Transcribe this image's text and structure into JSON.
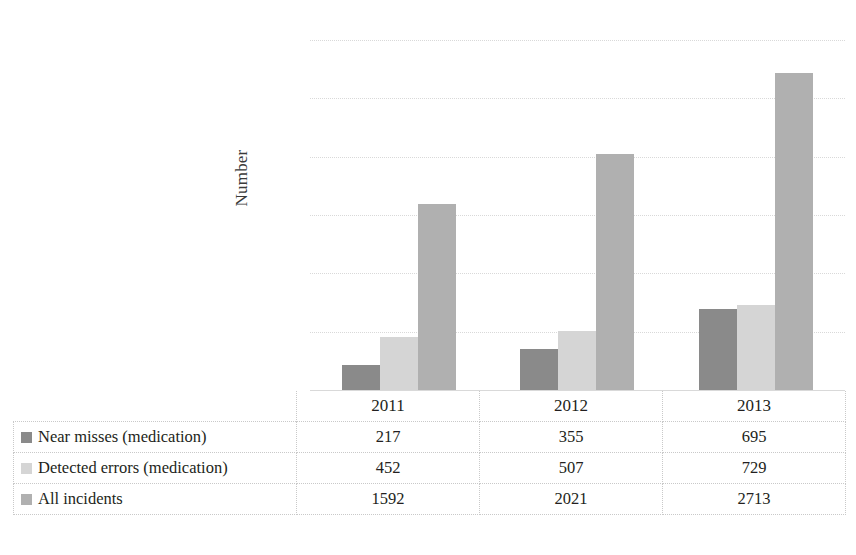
{
  "chart_data": {
    "type": "bar",
    "title": "",
    "xlabel": "",
    "ylabel": "Number",
    "ylim": [
      0,
      3000
    ],
    "ytick_step": 500,
    "yticks": [
      "3000",
      "2500",
      "2000",
      "1500",
      "1000",
      "500",
      "0"
    ],
    "grid": true,
    "legend_position": "table-row-labels",
    "categories": [
      "2011",
      "2012",
      "2013"
    ],
    "series": [
      {
        "name": "Near misses (medication)",
        "color": "#8a8a8a",
        "values": [
          217,
          355,
          695
        ],
        "labels": [
          "217",
          "355",
          "695"
        ]
      },
      {
        "name": "Detected errors (medication)",
        "color": "#d5d5d5",
        "values": [
          452,
          507,
          729
        ],
        "labels": [
          "452",
          "507",
          "729"
        ]
      },
      {
        "name": "All incidents",
        "color": "#b0b0b0",
        "values": [
          1592,
          2021,
          2713
        ],
        "labels": [
          "1592",
          "2021",
          "2713"
        ]
      }
    ]
  },
  "table": {
    "corner_label": "",
    "column_headers": [
      "2011",
      "2012",
      "2013"
    ],
    "rows": [
      {
        "label": "Near misses (medication)",
        "swatch_color": "#8a8a8a",
        "values": [
          "217",
          "355",
          "695"
        ]
      },
      {
        "label": "Detected errors (medication)",
        "swatch_color": "#d5d5d5",
        "values": [
          "452",
          "507",
          "729"
        ]
      },
      {
        "label": "All incidents",
        "swatch_color": "#b0b0b0",
        "values": [
          "1592",
          "2021",
          "2713"
        ]
      }
    ]
  },
  "axis": {
    "y_title": "Number"
  }
}
